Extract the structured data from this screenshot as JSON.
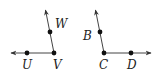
{
  "figures": [
    {
      "name": "angle-UVW",
      "vertex": {
        "label": "V",
        "x": 54,
        "y": 53
      },
      "points": [
        {
          "label": "U",
          "x": 27,
          "y": 53
        },
        {
          "label": "W",
          "x": 50,
          "y": 32
        }
      ],
      "rays": [
        {
          "from": [
            54,
            53
          ],
          "to": [
            10,
            53
          ]
        },
        {
          "from": [
            54,
            53
          ],
          "to": [
            45,
            9
          ]
        }
      ]
    },
    {
      "name": "angle-BCD",
      "vertex": {
        "label": "C",
        "x": 104,
        "y": 53
      },
      "points": [
        {
          "label": "B",
          "x": 100,
          "y": 32
        },
        {
          "label": "D",
          "x": 131,
          "y": 53
        }
      ],
      "rays": [
        {
          "from": [
            104,
            53
          ],
          "to": [
            152,
            53
          ]
        },
        {
          "from": [
            104,
            53
          ],
          "to": [
            95,
            9
          ]
        }
      ]
    }
  ],
  "labels": {
    "U": "U",
    "V": "V",
    "W": "W",
    "B": "B",
    "C": "C",
    "D": "D"
  },
  "colors": {
    "stroke": "#333333",
    "point": "#111111"
  }
}
